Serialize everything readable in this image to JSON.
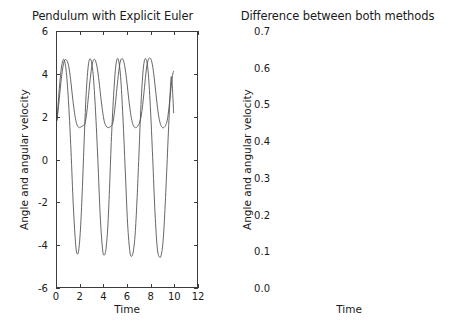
{
  "figure": {
    "width": 450,
    "height": 334,
    "background": "#ffffff",
    "line_color": "#4a4a4a",
    "axis_color": "#3c3c3c",
    "text_color": "#1a1a1a"
  },
  "chart_data": [
    {
      "type": "line",
      "panel": "left",
      "title": "Pendulum with Explicit Euler",
      "xlabel": "Time",
      "ylabel": "Angle and angular velocity",
      "xlim": [
        0,
        12
      ],
      "ylim": [
        -6,
        6
      ],
      "xticks": [
        0,
        2,
        4,
        6,
        8,
        10,
        12
      ],
      "xticklabels": [
        "0",
        "2",
        "4",
        "6",
        "8",
        "10",
        "12"
      ],
      "yticks": [
        -6,
        -4,
        -2,
        0,
        2,
        4,
        6
      ],
      "yticklabels": [
        "-6",
        "-4",
        "-2",
        "0",
        "2",
        "4",
        "6"
      ],
      "grid": false,
      "legend": null,
      "series": [
        {
          "name": "angle",
          "comment": "slow-varying curve oscillating between about 1.5 and 4.75, growing amplitude",
          "x": [
            0.0,
            0.15,
            0.3,
            0.45,
            0.6,
            0.75,
            0.9,
            1.05,
            1.2,
            1.35,
            1.5,
            1.65,
            1.8,
            1.95,
            2.1,
            2.25,
            2.4,
            2.55,
            2.7,
            2.85,
            3.0,
            3.15,
            3.3,
            3.45,
            3.6,
            3.75,
            3.9,
            4.05,
            4.2,
            4.35,
            4.5,
            4.65,
            4.8,
            4.95,
            5.1,
            5.25,
            5.4,
            5.55,
            5.7,
            5.85,
            6.0,
            6.15,
            6.3,
            6.45,
            6.6,
            6.75,
            6.9,
            7.05,
            7.2,
            7.35,
            7.5,
            7.65,
            7.8,
            7.95,
            8.1,
            8.25,
            8.4,
            8.55,
            8.7,
            8.85,
            9.0,
            9.15,
            9.3,
            9.45,
            9.6,
            9.75,
            9.9,
            10.0
          ],
          "y": [
            1.85,
            2.6,
            3.45,
            4.15,
            4.6,
            4.7,
            4.6,
            4.25,
            3.6,
            2.85,
            2.2,
            1.75,
            1.55,
            1.5,
            1.55,
            1.6,
            1.7,
            2.2,
            3.0,
            3.8,
            4.45,
            4.7,
            4.65,
            4.3,
            3.7,
            2.95,
            2.3,
            1.8,
            1.58,
            1.5,
            1.52,
            1.58,
            1.75,
            2.35,
            3.15,
            3.95,
            4.55,
            4.75,
            4.65,
            4.25,
            3.6,
            2.85,
            2.2,
            1.75,
            1.55,
            1.5,
            1.55,
            1.7,
            2.0,
            2.6,
            3.4,
            4.2,
            4.65,
            4.78,
            4.65,
            4.2,
            3.5,
            2.75,
            2.1,
            1.7,
            1.52,
            1.5,
            1.6,
            1.85,
            2.45,
            3.25,
            3.95,
            4.15
          ]
        },
        {
          "name": "angular velocity",
          "comment": "fast sawtooth-like oscillation between about -4.45 and +4.75",
          "x": [
            0.0,
            0.2,
            0.4,
            0.6,
            0.8,
            1.0,
            1.2,
            1.4,
            1.6,
            1.75,
            1.9,
            2.05,
            2.2,
            2.35,
            2.5,
            2.7,
            2.9,
            3.1,
            3.3,
            3.5,
            3.7,
            3.9,
            4.05,
            4.2,
            4.35,
            4.5,
            4.65,
            4.85,
            5.05,
            5.25,
            5.45,
            5.65,
            5.85,
            6.05,
            6.25,
            6.4,
            6.55,
            6.7,
            6.85,
            7.0,
            7.2,
            7.4,
            7.6,
            7.8,
            8.0,
            8.2,
            8.4,
            8.6,
            8.8,
            8.95,
            9.1,
            9.25,
            9.4,
            9.6,
            9.8,
            10.0
          ],
          "y": [
            1.85,
            3.35,
            4.4,
            4.7,
            4.1,
            2.6,
            0.4,
            -2.2,
            -4.0,
            -4.45,
            -4.1,
            -2.9,
            -1.0,
            1.2,
            3.1,
            4.5,
            4.7,
            4.0,
            2.3,
            0.0,
            -2.6,
            -4.2,
            -4.5,
            -4.2,
            -3.2,
            -1.4,
            0.8,
            3.0,
            4.45,
            4.72,
            3.9,
            2.0,
            -0.5,
            -3.0,
            -4.35,
            -4.55,
            -4.3,
            -3.5,
            -2.0,
            -0.1,
            2.6,
            4.3,
            4.75,
            4.2,
            2.5,
            0.1,
            -2.5,
            -4.2,
            -4.6,
            -4.45,
            -3.8,
            -2.4,
            -0.6,
            1.9,
            3.9,
            2.2
          ]
        }
      ]
    },
    {
      "type": "line",
      "panel": "right",
      "title": "Difference between both methods",
      "xlabel": "Time",
      "ylabel": "Angle and angular velocity",
      "xlim": [
        0,
        12
      ],
      "ylim": [
        0.0,
        0.7
      ],
      "xticks": [
        0,
        2,
        4,
        6,
        8,
        10,
        12
      ],
      "xticklabels": [
        "0",
        "2",
        "4",
        "6",
        "8",
        "10",
        "12"
      ],
      "yticks": [
        0.0,
        0.1,
        0.2,
        0.3,
        0.4,
        0.5,
        0.6,
        0.7
      ],
      "yticklabels": [
        "0.0",
        "0.1",
        "0.2",
        "0.3",
        "0.4",
        "0.5",
        "0.6",
        "0.7"
      ],
      "grid": false,
      "legend": null,
      "series": [
        {
          "name": "angle difference",
          "comment": "growing envelope of rounded humps, peaks rising 0.02, 0.05, 0.10, 0.17, 0.26, 0.40, 0.52, 0.68",
          "x": [
            0.0,
            0.3,
            0.6,
            0.9,
            1.2,
            1.45,
            1.7,
            1.9,
            2.1,
            2.35,
            2.6,
            2.9,
            3.2,
            3.5,
            3.8,
            4.05,
            4.3,
            4.5,
            4.7,
            5.0,
            5.3,
            5.6,
            5.9,
            6.1,
            6.3,
            6.5,
            6.7,
            7.0,
            7.3,
            7.6,
            7.85,
            8.05,
            8.25,
            8.5,
            8.8,
            9.1,
            9.4,
            9.6,
            9.8,
            10.0
          ],
          "y": [
            0.0,
            0.012,
            0.019,
            0.021,
            0.018,
            0.012,
            0.006,
            0.004,
            0.012,
            0.032,
            0.05,
            0.053,
            0.048,
            0.035,
            0.02,
            0.012,
            0.03,
            0.06,
            0.085,
            0.1,
            0.095,
            0.075,
            0.045,
            0.03,
            0.06,
            0.12,
            0.19,
            0.255,
            0.26,
            0.225,
            0.16,
            0.1,
            0.12,
            0.25,
            0.39,
            0.52,
            0.6,
            0.52,
            0.42,
            0.36
          ]
        },
        {
          "name": "angular velocity difference",
          "comment": "sharper spiky oscillation with peaks 0.01, 0.025, 0.055, 0.10, 0.15, 0.21, 0.275, 0.36 and deep zeros",
          "x": [
            0.0,
            0.4,
            0.8,
            1.2,
            1.6,
            1.9,
            2.1,
            2.3,
            2.5,
            2.75,
            3.0,
            3.2,
            3.45,
            3.7,
            3.95,
            4.15,
            4.4,
            4.65,
            4.85,
            5.1,
            5.35,
            5.55,
            5.8,
            6.05,
            6.3,
            6.5,
            6.75,
            7.0,
            7.2,
            7.45,
            7.7,
            7.9,
            8.15,
            8.4,
            8.6,
            8.85,
            9.1,
            9.3,
            9.55,
            9.8,
            10.0
          ],
          "y": [
            0.0,
            0.004,
            0.008,
            0.01,
            0.006,
            0.001,
            0.012,
            0.026,
            0.012,
            0.0,
            0.022,
            0.045,
            0.022,
            0.0,
            0.04,
            0.072,
            0.035,
            0.0,
            0.055,
            0.105,
            0.05,
            0.0,
            0.08,
            0.152,
            0.075,
            0.0,
            0.11,
            0.21,
            0.105,
            0.0,
            0.145,
            0.275,
            0.14,
            0.0,
            0.18,
            0.36,
            0.18,
            0.0,
            0.23,
            0.4,
            0.2
          ]
        }
      ]
    }
  ]
}
